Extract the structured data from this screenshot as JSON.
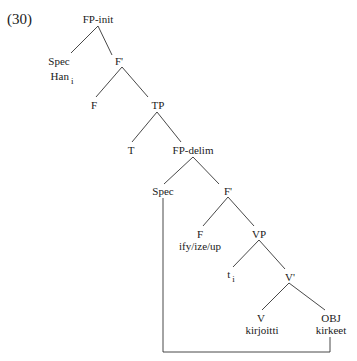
{
  "example_number": "(30)",
  "tree": {
    "root": "FP-init",
    "spec_top": {
      "label": "Spec",
      "word": "Han",
      "index": "i"
    },
    "fbar_top": "F'",
    "f_top": "F",
    "tp": "TP",
    "t": "T",
    "fp_delim": "FP-delim",
    "spec_mid": "Spec",
    "fbar_mid": "F'",
    "f_mid": {
      "label": "F",
      "word": "ify/ize/up"
    },
    "vp": "VP",
    "trace": {
      "label": "t",
      "index": "i"
    },
    "vbar": "V'",
    "v": {
      "label": "V",
      "word": "kirjoitti"
    },
    "obj": {
      "label": "OBJ",
      "word": "kirkeet"
    }
  },
  "colors": {
    "line": "#333333",
    "text": "#1a1a1a",
    "background": "#ffffff"
  }
}
